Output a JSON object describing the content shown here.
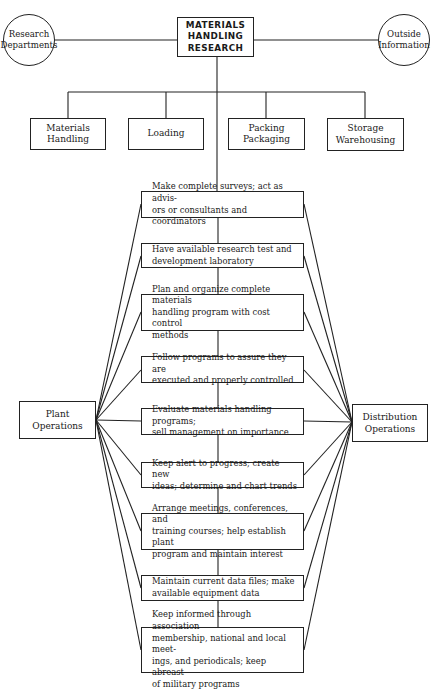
{
  "title": "MATERIALS\nHANDLING\nRESEARCH",
  "sources": {
    "left": "Research\nDepartments",
    "right": "Outside\nInformation"
  },
  "categories": [
    {
      "label": "Materials\nHandling"
    },
    {
      "label": "Loading"
    },
    {
      "label": "Packing\nPackaging"
    },
    {
      "label": "Storage\nWarehousing"
    }
  ],
  "activities": [
    {
      "label": "Make complete surveys; act as advis-\nors or consultants and coordinators"
    },
    {
      "label": "Have available research test and\ndevelopment laboratory"
    },
    {
      "label": "Plan and organize complete materials\nhandling program with cost control\nmethods"
    },
    {
      "label": "Follow programs to assure they are\nexecuted and properly controlled"
    },
    {
      "label": "Evaluate materials handling programs;\nsell management on importance"
    },
    {
      "label": "Keep alert to progress; create new\nideas; determine and chart trends"
    },
    {
      "label": "Arrange meetings, conferences, and\ntraining courses; help establish plant\nprogram and maintain interest"
    },
    {
      "label": "Maintain current data files; make\navailable equipment data"
    },
    {
      "label": "Keep informed through association\nmembership, national and local meet-\nings, and periodicals; keep abreast\nof military programs"
    }
  ],
  "outputs": {
    "left": "Plant\nOperations",
    "right": "Distribution\nOperations"
  }
}
